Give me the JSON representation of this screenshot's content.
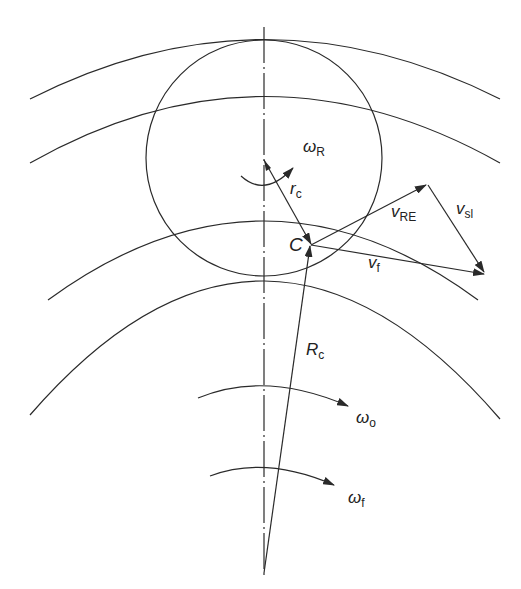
{
  "diagram": {
    "type": "kinematic diagram of rolling element in bearing raceway",
    "labels": {
      "omega_R": {
        "symbol": "ω",
        "sub": "R"
      },
      "r_c": {
        "symbol": "r",
        "sub": "c"
      },
      "C": {
        "symbol": "C"
      },
      "v_RE": {
        "symbol": "v",
        "sub": "RE"
      },
      "v_sl": {
        "symbol": "v",
        "sub": "sl"
      },
      "v_f": {
        "symbol": "v",
        "sub": "f"
      },
      "R_c": {
        "symbol": "R",
        "sub": "c"
      },
      "omega_o": {
        "symbol": "ω",
        "sub": "o"
      },
      "omega_f": {
        "symbol": "ω",
        "sub": "f"
      }
    },
    "elements": [
      "outer raceway arcs (2)",
      "inner raceway arcs (2)",
      "rolling element circle",
      "dash-dot vertical centerline",
      "vector r_c from rolling element center to point C",
      "vector R_c from bearing center to point C",
      "velocity triangle v_RE + v_sl = v_f",
      "rotation arrows ω_R, ω_o, ω_f"
    ],
    "stroke_color": "#2a2a2a"
  }
}
